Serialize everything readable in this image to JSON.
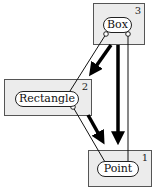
{
  "diagram": {
    "nodes": [
      {
        "id": "box",
        "label": "Box",
        "number": "3"
      },
      {
        "id": "rectangle",
        "label": "Rectangle",
        "number": "2"
      },
      {
        "id": "point",
        "label": "Point",
        "number": "1"
      }
    ],
    "edges": [
      {
        "from": "box",
        "to": "rectangle",
        "style": "thick-arrow"
      },
      {
        "from": "box",
        "to": "point",
        "style": "thick-arrow"
      },
      {
        "from": "rectangle",
        "to": "point",
        "style": "thick-arrow"
      },
      {
        "from": "box",
        "to": "rectangle",
        "style": "thin-line-circle"
      },
      {
        "from": "box",
        "to": "point",
        "style": "thin-line-circle"
      },
      {
        "from": "rectangle",
        "to": "point",
        "style": "thin-line-circle"
      }
    ]
  }
}
